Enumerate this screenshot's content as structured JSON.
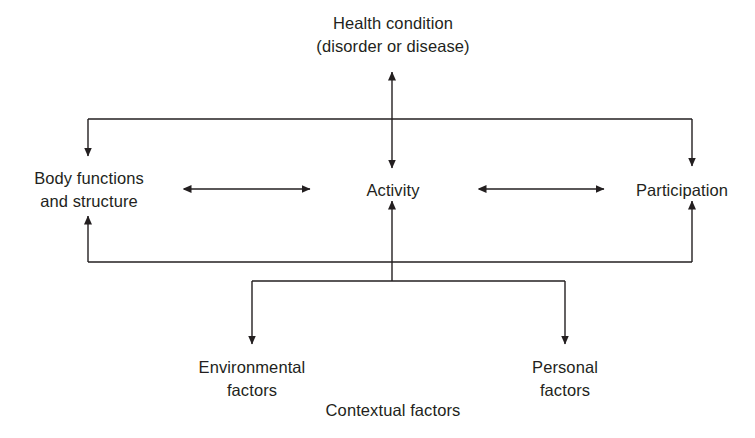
{
  "diagram": {
    "line_color": "#231f20",
    "text_color": "#231f20",
    "background_color": "#ffffff",
    "nodes": {
      "health_condition": "Health condition\n(disorder or disease)",
      "body_functions": "Body functions\nand structure",
      "activity": "Activity",
      "participation": "Participation",
      "environmental_factors": "Environmental\nfactors",
      "personal_factors": "Personal\nfactors",
      "contextual_factors": "Contextual factors"
    },
    "connectors": [
      {
        "name": "health-condition-to-activity",
        "from": "health_condition",
        "to": "activity",
        "style": "double-headed-vertical"
      },
      {
        "name": "top-bus-to-body-functions",
        "from": "health_condition",
        "to": "body_functions",
        "style": "elbow-arrow-down"
      },
      {
        "name": "top-bus-to-participation",
        "from": "health_condition",
        "to": "participation",
        "style": "elbow-arrow-down"
      },
      {
        "name": "body-functions-to-activity",
        "from": "body_functions",
        "to": "activity",
        "style": "double-headed-horizontal"
      },
      {
        "name": "activity-to-participation",
        "from": "activity",
        "to": "participation",
        "style": "double-headed-horizontal"
      },
      {
        "name": "bottom-bus-to-body-functions",
        "from": "contextual_factors",
        "to": "body_functions",
        "style": "elbow-arrow-up"
      },
      {
        "name": "bottom-bus-to-participation",
        "from": "contextual_factors",
        "to": "participation",
        "style": "elbow-arrow-up"
      },
      {
        "name": "activity-to-environmental-factors",
        "from": "activity",
        "to": "environmental_factors",
        "style": "elbow-arrow-down"
      },
      {
        "name": "activity-to-personal-factors",
        "from": "activity",
        "to": "personal_factors",
        "style": "elbow-arrow-down"
      }
    ]
  }
}
